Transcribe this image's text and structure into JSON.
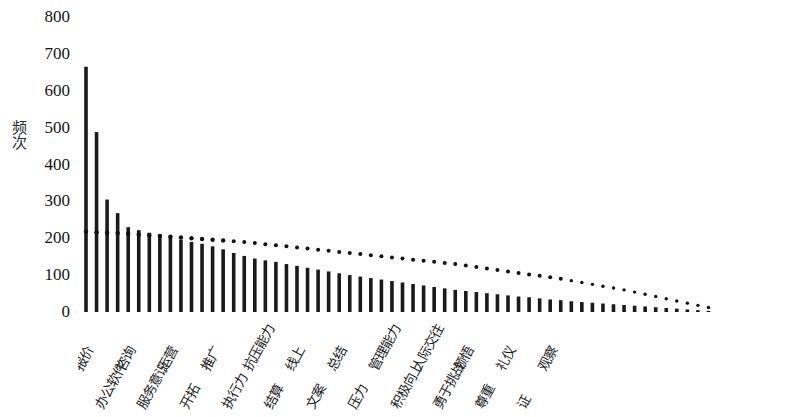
{
  "chart_data": {
    "type": "bar",
    "title": "",
    "subtitle": "",
    "xlabel": "",
    "ylabel": "频次",
    "ylim": [
      0,
      800
    ],
    "ytick_values": [
      800,
      700,
      600,
      500,
      400,
      300,
      200,
      100,
      0
    ],
    "ytick_labels": [
      "800",
      "700",
      "600",
      "500",
      "400",
      "300",
      "200",
      "100",
      "0"
    ],
    "grid": false,
    "legend": "none",
    "categories": [
      "报价",
      "办公软件",
      "咨询",
      "服务意识",
      "运营",
      "开拓",
      "推广",
      "执行力",
      "抗压能力",
      "结算",
      "线上",
      "文案",
      "总结",
      "压力",
      "管理能力",
      "积极向上",
      "人际交往",
      "勇于挑战",
      "领悟",
      "尊重",
      "礼仪",
      "证",
      "观察",
      "c24",
      "c25",
      "c26",
      "c27",
      "c28",
      "c29",
      "c30",
      "c31",
      "c32",
      "c33",
      "c34",
      "c35",
      "c36",
      "c37",
      "c38",
      "c39",
      "c40",
      "c41",
      "c42",
      "c43",
      "c44",
      "c45",
      "c46",
      "c47",
      "c48",
      "c49",
      "c50",
      "c51",
      "c52",
      "c53",
      "c54",
      "c55",
      "c56",
      "c57",
      "c58",
      "c59",
      "c60"
    ],
    "labeled_categories": [
      "报价",
      "办公软件",
      "咨询",
      "服务意识",
      "运营",
      "开拓",
      "推广",
      "执行力",
      "抗压能力",
      "结算",
      "线上",
      "文案",
      "总结",
      "压力",
      "管理能力",
      "积极向上",
      "人际交往",
      "勇于挑战",
      "领悟",
      "尊重",
      "礼仪",
      "证",
      "观察"
    ],
    "values": [
      665,
      488,
      305,
      268,
      230,
      222,
      215,
      210,
      205,
      196,
      190,
      185,
      178,
      170,
      160,
      152,
      145,
      140,
      136,
      130,
      125,
      120,
      115,
      110,
      105,
      100,
      96,
      92,
      88,
      84,
      80,
      76,
      72,
      68,
      64,
      60,
      57,
      54,
      51,
      48,
      45,
      42,
      40,
      37,
      34,
      32,
      29,
      27,
      25,
      23,
      21,
      19,
      17,
      15,
      13,
      11,
      9,
      7,
      5,
      3
    ],
    "series": [
      {
        "name": "频次",
        "type": "bar",
        "values": [
          665,
          488,
          305,
          268,
          230,
          222,
          215,
          210,
          205,
          196,
          190,
          185,
          178,
          170,
          160,
          152,
          145,
          140,
          136,
          130,
          125,
          120,
          115,
          110,
          105,
          100,
          96,
          92,
          88,
          84,
          80,
          76,
          72,
          68,
          64,
          60,
          57,
          54,
          51,
          48,
          45,
          42,
          40,
          37,
          34,
          32,
          29,
          27,
          25,
          23,
          21,
          19,
          17,
          15,
          13,
          11,
          9,
          7,
          5,
          3
        ]
      },
      {
        "name": "趋势线",
        "type": "dotted-line",
        "values": [
          218,
          216,
          215,
          214,
          212,
          210,
          208,
          206,
          204,
          202,
          200,
          198,
          196,
          194,
          192,
          190,
          187,
          184,
          181,
          178,
          175,
          172,
          169,
          166,
          163,
          160,
          157,
          154,
          151,
          148,
          145,
          142,
          139,
          136,
          133,
          130,
          126,
          122,
          118,
          114,
          110,
          106,
          102,
          98,
          94,
          90,
          85,
          80,
          75,
          70,
          65,
          60,
          54,
          48,
          42,
          36,
          30,
          24,
          18,
          12
        ]
      }
    ],
    "bar_color": "#1a1a1a",
    "line_color": "#111111",
    "axis_color": "#2b2b2b",
    "background": "#ffffff"
  },
  "axes": {
    "y_title": "频次"
  }
}
